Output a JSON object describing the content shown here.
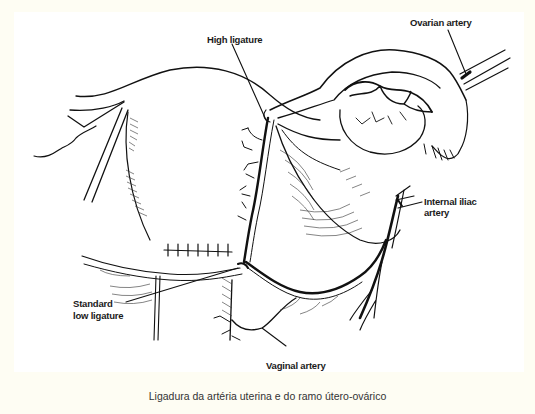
{
  "figure": {
    "labels": {
      "high_ligature": "High ligature",
      "ovarian_artery": "Ovarian artery",
      "internal_iliac_line1": "Internal iliac",
      "internal_iliac_line2": "artery",
      "standard_low_line1": "Standard",
      "standard_low_line2": "low ligature",
      "vaginal_artery": "Vaginal artery"
    },
    "caption": "Ligadura da artéria uterina e do ramo útero-ovárico",
    "colors": {
      "background": "#fefdf3",
      "drawing_area": "#ffffff",
      "ink": "#111111",
      "caption_text": "#333333"
    }
  }
}
